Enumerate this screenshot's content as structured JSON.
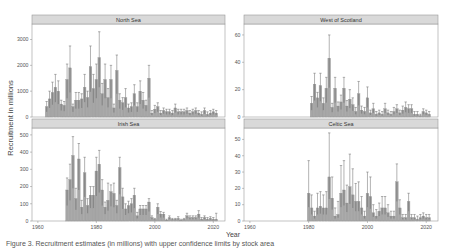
{
  "chart_data": [
    {
      "type": "bar",
      "title": "North Sea",
      "xlabel": "Year",
      "ylabel": "Recruitment in millions",
      "xlim": [
        1958,
        2024
      ],
      "ylim": [
        0,
        3600
      ],
      "yticks": [
        0,
        1000,
        2000,
        3000
      ],
      "xticks": [
        1960,
        1980,
        2000,
        2020
      ],
      "grid": false,
      "error_bars": true,
      "x": [
        1963,
        1964,
        1965,
        1966,
        1967,
        1968,
        1969,
        1970,
        1971,
        1972,
        1973,
        1974,
        1975,
        1976,
        1977,
        1978,
        1979,
        1980,
        1981,
        1982,
        1983,
        1984,
        1985,
        1986,
        1987,
        1988,
        1989,
        1990,
        1991,
        1992,
        1993,
        1994,
        1995,
        1996,
        1997,
        1998,
        1999,
        2000,
        2001,
        2002,
        2003,
        2004,
        2005,
        2006,
        2007,
        2008,
        2009,
        2010,
        2011,
        2012,
        2013,
        2014,
        2015,
        2016,
        2017,
        2018,
        2019,
        2020,
        2021
      ],
      "values": [
        400,
        700,
        950,
        1150,
        1000,
        500,
        450,
        1450,
        1900,
        400,
        650,
        650,
        700,
        1150,
        750,
        1950,
        1100,
        1450,
        2300,
        900,
        1450,
        750,
        1450,
        350,
        1800,
        650,
        550,
        750,
        350,
        400,
        900,
        400,
        1000,
        650,
        450,
        1500,
        150,
        300,
        400,
        150,
        250,
        200,
        200,
        150,
        350,
        200,
        200,
        200,
        250,
        150,
        200,
        250,
        150,
        100,
        250,
        100,
        150,
        200,
        150
      ],
      "upper": [
        600,
        1000,
        1350,
        1650,
        1400,
        650,
        600,
        2050,
        2750,
        500,
        950,
        950,
        900,
        1650,
        1000,
        2750,
        1650,
        2050,
        3300,
        1300,
        2050,
        1100,
        2000,
        500,
        2400,
        900,
        750,
        1100,
        500,
        550,
        1250,
        550,
        1400,
        950,
        650,
        2000,
        250,
        450,
        550,
        250,
        350,
        300,
        300,
        250,
        500,
        300,
        300,
        300,
        350,
        250,
        300,
        350,
        250,
        200,
        350,
        200,
        250,
        300,
        250
      ]
    },
    {
      "type": "bar",
      "title": "West of Scotland",
      "xlabel": "Year",
      "ylabel": "Recruitment in millions",
      "xlim": [
        1958,
        2024
      ],
      "ylim": [
        0,
        68
      ],
      "yticks": [
        0,
        20,
        40,
        60
      ],
      "xticks": [
        1960,
        1980,
        2000,
        2020
      ],
      "grid": false,
      "error_bars": true,
      "x": [
        1981,
        1982,
        1983,
        1984,
        1985,
        1986,
        1987,
        1988,
        1989,
        1990,
        1991,
        1992,
        1993,
        1994,
        1995,
        1996,
        1997,
        1998,
        1999,
        2000,
        2001,
        2002,
        2003,
        2004,
        2005,
        2006,
        2007,
        2008,
        2009,
        2010,
        2011,
        2012,
        2013,
        2014,
        2015,
        2016,
        2017,
        2018,
        2019,
        2020,
        2021
      ],
      "values": [
        10,
        24,
        14,
        23,
        10,
        21,
        43,
        7,
        21,
        8,
        11,
        21,
        8,
        13,
        9,
        4,
        17,
        5,
        4,
        14,
        3,
        6,
        2,
        3,
        2,
        6,
        3,
        2,
        4,
        6,
        3,
        5,
        7,
        6,
        6,
        2,
        2,
        1,
        4,
        3,
        2
      ],
      "upper": [
        15,
        32,
        18,
        32,
        14,
        29,
        60,
        10,
        29,
        11,
        16,
        29,
        12,
        20,
        14,
        7,
        26,
        8,
        7,
        22,
        5,
        10,
        4,
        5,
        4,
        10,
        5,
        4,
        7,
        9,
        5,
        8,
        11,
        9,
        9,
        4,
        4,
        2,
        6,
        5,
        4
      ]
    },
    {
      "type": "bar",
      "title": "Irish Sea",
      "xlabel": "Year",
      "ylabel": "Recruitment in millions",
      "xlim": [
        1958,
        2024
      ],
      "ylim": [
        0,
        540
      ],
      "yticks": [
        0,
        100,
        200,
        300,
        400,
        500
      ],
      "xticks": [
        1960,
        1980,
        2000,
        2020
      ],
      "grid": false,
      "error_bars": true,
      "x": [
        1970,
        1971,
        1972,
        1973,
        1974,
        1975,
        1976,
        1977,
        1978,
        1979,
        1980,
        1981,
        1982,
        1983,
        1984,
        1985,
        1986,
        1987,
        1988,
        1989,
        1990,
        1991,
        1992,
        1993,
        1994,
        1995,
        1996,
        1997,
        1998,
        1999,
        2000,
        2001,
        2002,
        2003,
        2004,
        2005,
        2006,
        2007,
        2008,
        2009,
        2010,
        2011,
        2012,
        2013,
        2014,
        2015,
        2016,
        2017,
        2018,
        2019,
        2020,
        2021
      ],
      "values": [
        180,
        240,
        380,
        130,
        360,
        80,
        280,
        90,
        150,
        150,
        290,
        330,
        180,
        80,
        120,
        170,
        160,
        90,
        310,
        140,
        70,
        90,
        100,
        150,
        30,
        70,
        70,
        70,
        110,
        20,
        10,
        80,
        40,
        40,
        5,
        20,
        10,
        10,
        15,
        5,
        10,
        30,
        20,
        20,
        20,
        40,
        10,
        20,
        10,
        15,
        10,
        10
      ],
      "upper": [
        250,
        330,
        490,
        190,
        450,
        120,
        370,
        130,
        200,
        200,
        370,
        410,
        240,
        110,
        220,
        210,
        220,
        120,
        370,
        190,
        100,
        115,
        130,
        190,
        50,
        90,
        90,
        90,
        130,
        30,
        15,
        100,
        55,
        50,
        10,
        30,
        15,
        15,
        25,
        10,
        15,
        45,
        30,
        30,
        30,
        60,
        20,
        30,
        20,
        25,
        20,
        45
      ]
    },
    {
      "type": "bar",
      "title": "Celtic Sea",
      "xlabel": "Year",
      "ylabel": "Recruitment in millions",
      "xlim": [
        1958,
        2024
      ],
      "ylim": [
        0,
        57
      ],
      "yticks": [
        0,
        10,
        20,
        30,
        40,
        50
      ],
      "xticks": [
        1960,
        1980,
        2000,
        2020
      ],
      "grid": false,
      "error_bars": true,
      "x": [
        1980,
        1981,
        1982,
        1983,
        1984,
        1985,
        1986,
        1987,
        1988,
        1989,
        1990,
        1991,
        1992,
        1993,
        1994,
        1995,
        1996,
        1997,
        1998,
        1999,
        2000,
        2001,
        2002,
        2003,
        2004,
        2005,
        2006,
        2007,
        2008,
        2009,
        2010,
        2011,
        2012,
        2013,
        2014,
        2015,
        2016,
        2017,
        2018,
        2019,
        2020,
        2021
      ],
      "values": [
        17,
        8,
        3,
        8,
        9,
        8,
        8,
        27,
        14,
        3,
        4,
        17,
        19,
        11,
        21,
        16,
        12,
        12,
        8,
        3,
        17,
        15,
        5,
        3,
        6,
        8,
        8,
        5,
        3,
        3,
        24,
        8,
        2,
        2,
        12,
        2,
        2,
        1,
        2,
        3,
        2,
        2
      ],
      "upper": [
        37,
        16,
        6,
        17,
        18,
        16,
        18,
        54,
        27,
        8,
        12,
        34,
        37,
        22,
        41,
        32,
        23,
        24,
        15,
        6,
        30,
        27,
        10,
        7,
        11,
        15,
        15,
        10,
        6,
        6,
        35,
        13,
        4,
        4,
        17,
        4,
        4,
        3,
        4,
        5,
        4,
        4
      ]
    }
  ],
  "figure": {
    "ylabel": "Recruitment in millions",
    "xlabel": "Year",
    "panel_titles": [
      "North Sea",
      "West of Scotland",
      "Irish Sea",
      "Celtic Sea"
    ],
    "colors": {
      "bar_fill": "#a6a6a6",
      "bar_stroke": "#8c8c8c",
      "bar_dark": "#707070",
      "error_bar": "#666666",
      "strip_fill": "#d9d9d9",
      "panel_border": "#999999",
      "axis_text": "#555555"
    }
  },
  "caption": "Figure 3. Recruitment estimates (in millions) with upper confidence limits by stock area"
}
